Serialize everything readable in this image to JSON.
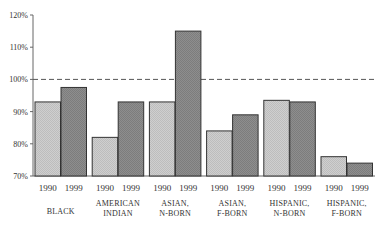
{
  "chart_data": {
    "type": "bar",
    "title": "",
    "xlabel": "",
    "ylabel": "",
    "ylim": [
      70,
      120
    ],
    "yticks": [
      "70%",
      "80%",
      "90%",
      "100%",
      "110%",
      "120%"
    ],
    "grid": false,
    "legend": null,
    "reference_line": {
      "value": 100,
      "style": "dashed"
    },
    "categories": [
      [
        "BLACK"
      ],
      [
        "AMERICAN",
        "INDIAN"
      ],
      [
        "ASIAN,",
        "N-BORN"
      ],
      [
        "ASIAN,",
        "F-BORN"
      ],
      [
        "HISPANIC,",
        "N-BORN"
      ],
      [
        "HISPANIC,",
        "F-BORN"
      ]
    ],
    "series": [
      {
        "name": "1990",
        "fill": "#c8c8c8",
        "values": [
          93,
          82,
          93,
          84,
          93.5,
          76
        ]
      },
      {
        "name": "1999",
        "fill": "#8a8a8a",
        "values": [
          97.5,
          93,
          115,
          89,
          93,
          74
        ]
      }
    ]
  }
}
